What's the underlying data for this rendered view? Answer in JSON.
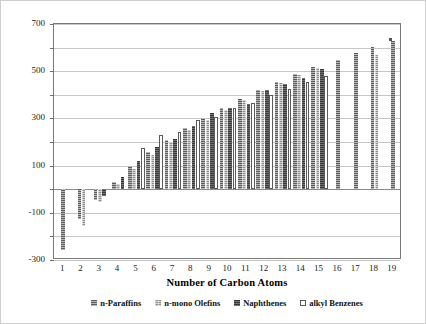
{
  "chart_data": {
    "type": "bar",
    "title": "",
    "xlabel": "Number of Carbon Atoms",
    "ylabel": "Boiling Point, °F",
    "ylim": [
      -300,
      700
    ],
    "ytick_labels": [
      "700",
      "500",
      "300",
      "100",
      "-100",
      "-300"
    ],
    "ytick_values": [
      700,
      500,
      300,
      100,
      -100,
      -300
    ],
    "gridline_values": [
      700,
      600,
      500,
      400,
      300,
      200,
      100,
      0,
      -100,
      -200,
      -300
    ],
    "grid": true,
    "legend_position": "bottom",
    "categories": [
      "1",
      "2",
      "3",
      "4",
      "5",
      "6",
      "7",
      "8",
      "9",
      "10",
      "11",
      "12",
      "13",
      "14",
      "15",
      "16",
      "17",
      "18",
      "19"
    ],
    "series": [
      {
        "name": "n-Paraffins",
        "swatch": "dark-grey-hatch",
        "values": [
          -259,
          -128,
          -44,
          31,
          97,
          156,
          209,
          258,
          303,
          345,
          384,
          421,
          455,
          488,
          519,
          548,
          576,
          602,
          626
        ]
      },
      {
        "name": "n-mono Olefins",
        "swatch": "light-grey-mesh",
        "values": [
          null,
          -155,
          -54,
          21,
          86,
          146,
          199,
          250,
          295,
          337,
          377,
          414,
          449,
          482,
          513,
          null,
          null,
          570,
          null
        ]
      },
      {
        "name": "Naphthenes",
        "swatch": "solid-black",
        "values": [
          null,
          null,
          -27,
          50,
          121,
          177,
          214,
          266,
          323,
          345,
          362,
          419,
          447,
          473,
          509,
          null,
          null,
          null,
          null
        ]
      },
      {
        "name": "alkyl Benzenes",
        "swatch": "white-open",
        "values": [
          null,
          null,
          null,
          null,
          176,
          231,
          243,
          293,
          307,
          345,
          367,
          400,
          426,
          455,
          480,
          null,
          null,
          null,
          null
        ]
      }
    ]
  },
  "legend": {
    "items": [
      {
        "label": "n-Paraffins"
      },
      {
        "label": "n-mono Olefins"
      },
      {
        "label": "Naphthenes"
      },
      {
        "label": "alkyl Benzenes"
      }
    ]
  }
}
